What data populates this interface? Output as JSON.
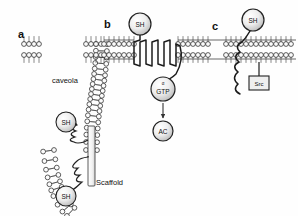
{
  "figure": {
    "type": "diagram",
    "background_color": "#fefefe",
    "line_color": "#222222",
    "fill_color": "#e8e8e8",
    "panels": [
      {
        "id": "a",
        "letter": "a",
        "letter_x": 18,
        "letter_y": 38,
        "labels": [
          {
            "name": "caveola-label",
            "text": "caveola",
            "x": 52,
            "y": 83
          },
          {
            "name": "scaffold-label",
            "text": "Scaffold",
            "x": 96,
            "y": 185
          }
        ],
        "nodes": [
          {
            "name": "sh-node-upper",
            "text": "SH",
            "cx": 66,
            "cy": 122,
            "r": 10
          },
          {
            "name": "sh-node-lower",
            "text": "SH",
            "cx": 66,
            "cy": 196,
            "r": 10
          }
        ]
      },
      {
        "id": "b",
        "letter": "b",
        "letter_x": 104,
        "letter_y": 28,
        "labels": [],
        "nodes": [
          {
            "name": "sh-node-receptor",
            "text": "SH",
            "cx": 140,
            "cy": 24,
            "r": 11
          },
          {
            "name": "galpha-gtp-node",
            "text": "GTP",
            "supertext": "α",
            "cx": 163,
            "cy": 89,
            "r": 12
          },
          {
            "name": "adenylyl-cyclase-node",
            "text": "AC",
            "cx": 163,
            "cy": 131,
            "r": 10
          }
        ],
        "arrows": [
          {
            "name": "gtp-to-ac-arrow",
            "x1": 163,
            "y1": 103,
            "x2": 163,
            "y2": 119
          }
        ]
      },
      {
        "id": "c",
        "letter": "c",
        "letter_x": 212,
        "letter_y": 30,
        "labels": [],
        "nodes": [
          {
            "name": "sh-node-c",
            "text": "SH",
            "cx": 253,
            "cy": 20,
            "r": 11
          },
          {
            "name": "src-node",
            "text": "Src",
            "x": 249,
            "y": 82,
            "w": 20,
            "h": 14
          }
        ]
      }
    ],
    "membrane": {
      "name": "lipid-bilayer",
      "head_radius": 2.4,
      "tail_length": 5.5,
      "bilayer_gap": 11
    }
  }
}
